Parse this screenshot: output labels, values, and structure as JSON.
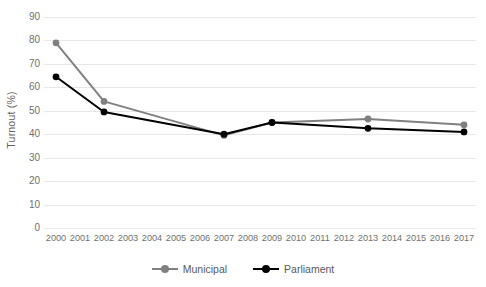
{
  "chart_data": {
    "type": "line",
    "title": "",
    "xlabel": "",
    "ylabel": "Turnout (%)",
    "ylim": [
      0,
      90
    ],
    "ytick_step": 10,
    "yticks": [
      90,
      80,
      70,
      60,
      50,
      40,
      30,
      20,
      10,
      0
    ],
    "categories": [
      "2000",
      "2001",
      "2002",
      "2003",
      "2004",
      "2005",
      "2006",
      "2007",
      "2008",
      "2009",
      "2010",
      "2011",
      "2012",
      "2013",
      "2014",
      "2015",
      "2016",
      "2017"
    ],
    "grid": true,
    "legend_position": "bottom-center",
    "series": [
      {
        "name": "Municipal",
        "color": "#808080",
        "points": [
          {
            "x": "2000",
            "y": 79.0
          },
          {
            "x": "2002",
            "y": 54.0
          },
          {
            "x": "2007",
            "y": 39.5
          },
          {
            "x": "2009",
            "y": 45.0
          },
          {
            "x": "2013",
            "y": 46.5
          },
          {
            "x": "2017",
            "y": 44.0
          }
        ],
        "values": [
          79.0,
          null,
          54.0,
          null,
          null,
          null,
          null,
          39.5,
          null,
          45.0,
          null,
          null,
          null,
          46.5,
          null,
          null,
          null,
          44.0
        ]
      },
      {
        "name": "Parliament",
        "color": "#000000",
        "points": [
          {
            "x": "2000",
            "y": 64.5
          },
          {
            "x": "2002",
            "y": 49.5
          },
          {
            "x": "2007",
            "y": 40.0
          },
          {
            "x": "2009",
            "y": 45.0
          },
          {
            "x": "2013",
            "y": 42.5
          },
          {
            "x": "2017",
            "y": 41.0
          }
        ],
        "values": [
          64.5,
          null,
          49.5,
          null,
          null,
          null,
          null,
          40.0,
          null,
          45.0,
          null,
          null,
          null,
          42.5,
          null,
          null,
          null,
          41.0
        ]
      }
    ]
  },
  "axis": {
    "y_title": "Turnout (%)"
  },
  "legend": {
    "items": [
      {
        "label": "Municipal",
        "color": "#808080"
      },
      {
        "label": "Parliament",
        "color": "#000000"
      }
    ]
  },
  "colors": {
    "municipal": "#808080",
    "parliament": "#000000",
    "gridline": "#e8e8e8",
    "tick_text": "#707070",
    "background": "#ffffff"
  }
}
